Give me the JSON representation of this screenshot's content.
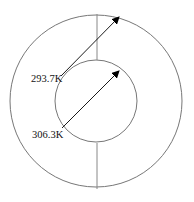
{
  "diagram": {
    "type": "concentric-cylinder-cross-section",
    "labels": {
      "outer": "293.7K",
      "inner": "306.3K"
    },
    "colors": {
      "circle_stroke": "#777777",
      "divider_stroke": "#888888",
      "arrow": "#000000",
      "text": "#111111"
    }
  }
}
